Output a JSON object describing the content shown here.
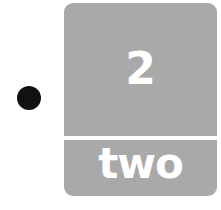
{
  "bullet": {
    "color": "#111111"
  },
  "card": {
    "number": "2",
    "word": "two",
    "background_color": "#a9a9a9",
    "text_color": "#ffffff"
  }
}
